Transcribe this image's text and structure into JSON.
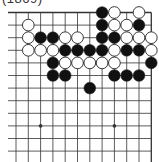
{
  "caption": "(1869)",
  "board": {
    "origin_x": 16,
    "origin_y": 12.5,
    "spacing_x": 12.3,
    "spacing_y": 12.6,
    "columns": 12,
    "rows": 12,
    "left_edge_open": true,
    "bottom_edge_open": true,
    "top_edge": true,
    "right_edge": true,
    "line_color": "#333333",
    "stone_black": "#111111",
    "stone_white": "#ffffff",
    "star_points": [
      [
        2,
        9
      ],
      [
        8,
        9
      ]
    ],
    "stones": [
      {
        "c": 7,
        "r": 0,
        "color": "black"
      },
      {
        "c": 8,
        "r": 0,
        "color": "white"
      },
      {
        "c": 10,
        "r": 0,
        "color": "white"
      },
      {
        "c": 1,
        "r": 1,
        "color": "white"
      },
      {
        "c": 7,
        "r": 1,
        "color": "black"
      },
      {
        "c": 8,
        "r": 1,
        "color": "white"
      },
      {
        "c": 9,
        "r": 1,
        "color": "white"
      },
      {
        "c": 10,
        "r": 1,
        "color": "black"
      },
      {
        "c": 1,
        "r": 2,
        "color": "white"
      },
      {
        "c": 2,
        "r": 2,
        "color": "black"
      },
      {
        "c": 3,
        "r": 2,
        "color": "black"
      },
      {
        "c": 4,
        "r": 2,
        "color": "white"
      },
      {
        "c": 5,
        "r": 2,
        "color": "white"
      },
      {
        "c": 7,
        "r": 2,
        "color": "black"
      },
      {
        "c": 8,
        "r": 2,
        "color": "black"
      },
      {
        "c": 9,
        "r": 2,
        "color": "white"
      },
      {
        "c": 10,
        "r": 2,
        "color": "white"
      },
      {
        "c": 11,
        "r": 2,
        "color": "white"
      },
      {
        "c": 1,
        "r": 3,
        "color": "white"
      },
      {
        "c": 2,
        "r": 3,
        "color": "white"
      },
      {
        "c": 3,
        "r": 3,
        "color": "white"
      },
      {
        "c": 4,
        "r": 3,
        "color": "black"
      },
      {
        "c": 5,
        "r": 3,
        "color": "black"
      },
      {
        "c": 6,
        "r": 3,
        "color": "black"
      },
      {
        "c": 7,
        "r": 3,
        "color": "black"
      },
      {
        "c": 8,
        "r": 3,
        "color": "white"
      },
      {
        "c": 9,
        "r": 3,
        "color": "black"
      },
      {
        "c": 10,
        "r": 3,
        "color": "black"
      },
      {
        "c": 11,
        "r": 3,
        "color": "white"
      },
      {
        "c": 3,
        "r": 4,
        "color": "black"
      },
      {
        "c": 4,
        "r": 4,
        "color": "white"
      },
      {
        "c": 5,
        "r": 4,
        "color": "white"
      },
      {
        "c": 6,
        "r": 4,
        "color": "white"
      },
      {
        "c": 7,
        "r": 4,
        "color": "white"
      },
      {
        "c": 8,
        "r": 4,
        "color": "white"
      },
      {
        "c": 11,
        "r": 4,
        "color": "black"
      },
      {
        "c": 3,
        "r": 5,
        "color": "black"
      },
      {
        "c": 4,
        "r": 5,
        "color": "black"
      },
      {
        "c": 8,
        "r": 5,
        "color": "black"
      },
      {
        "c": 9,
        "r": 5,
        "color": "black"
      },
      {
        "c": 10,
        "r": 5,
        "color": "black"
      },
      {
        "c": 6,
        "r": 6,
        "color": "black"
      }
    ]
  }
}
